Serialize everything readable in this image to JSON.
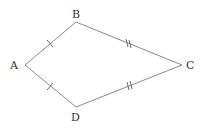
{
  "diagram": {
    "type": "kite",
    "stroke_color": "#8a8a8a",
    "vertices": {
      "A": {
        "label": "A",
        "x": 25,
        "y": 65
      },
      "B": {
        "label": "B",
        "x": 76,
        "y": 22
      },
      "C": {
        "label": "C",
        "x": 182,
        "y": 65
      },
      "D": {
        "label": "D",
        "x": 76,
        "y": 107
      }
    },
    "edges": [
      {
        "from": "A",
        "to": "B",
        "tick_marks": 1
      },
      {
        "from": "B",
        "to": "C",
        "tick_marks": 2
      },
      {
        "from": "C",
        "to": "D",
        "tick_marks": 2
      },
      {
        "from": "D",
        "to": "A",
        "tick_marks": 1
      }
    ]
  }
}
